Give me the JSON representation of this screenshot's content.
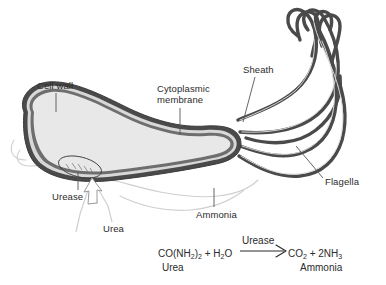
{
  "figure": {
    "colors": {
      "background": "#ffffff",
      "cytoplasm": "#e8e8e8",
      "envelope_dark": "#4a4a4a",
      "envelope_mid": "#6e6e6e",
      "envelope_light": "#d8d8d8",
      "cloud": "#cfcfcf",
      "text": "#2b2b2b",
      "leader": "#555555"
    }
  },
  "labels": {
    "cell_wall": "Cell wall",
    "cytoplasmic_membrane_line1": "Cytoplasmic",
    "cytoplasmic_membrane_line2": "membrane",
    "sheath": "Sheath",
    "flagella": "Flagella",
    "urease": "Urease",
    "urea": "Urea",
    "ammonia": "Ammonia"
  },
  "equation": {
    "reactants": "CO(NH",
    "reactants_sub1": "2",
    "reactants_mid": ")",
    "reactants_sub2": "2",
    "reactants_plus": " + H",
    "reactants_sub3": "2",
    "reactants_end": "O",
    "reactant_name": "Urea",
    "catalyst": "Urease",
    "products_start": "CO",
    "products_sub1": "2",
    "products_mid": " + 2NH",
    "products_sub2": "3",
    "product_name": "Ammonia"
  }
}
